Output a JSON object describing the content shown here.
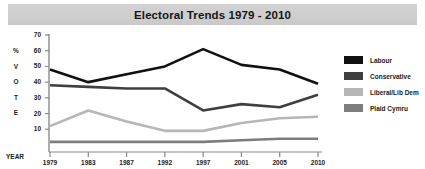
{
  "title": "Electoral Trends 1979 - 2010",
  "axis": {
    "year_label": "YEAR",
    "vote_label_chars": [
      "%",
      "V",
      "O",
      "T",
      "E"
    ]
  },
  "legend": {
    "items": [
      {
        "label": "Labour",
        "color": "#111111"
      },
      {
        "label": "Conservative",
        "color": "#3f3f3f"
      },
      {
        "label": "Liberal/Lib Dem",
        "color": "#b6b6b6"
      },
      {
        "label": "Plaid Cymru",
        "color": "#7d7d7d"
      }
    ]
  },
  "chart_data": {
    "type": "line",
    "title": "Electoral Trends 1979 - 2010",
    "xlabel": "YEAR",
    "ylabel": "% VOTE",
    "x": [
      "1979",
      "1983",
      "1987",
      "1992",
      "1997",
      "2001",
      "2005",
      "2010"
    ],
    "xticklabels": [
      "1979",
      "1983",
      "1987",
      "1992",
      "1997",
      "2001",
      "2005",
      "2010"
    ],
    "yticks": [
      10,
      20,
      30,
      40,
      50,
      60,
      70
    ],
    "ylim": [
      0,
      70
    ],
    "grid": false,
    "legend_position": "right",
    "series": [
      {
        "name": "Labour",
        "color": "#111111",
        "values": [
          48,
          40,
          45,
          50,
          61,
          51,
          48,
          39
        ]
      },
      {
        "name": "Conservative",
        "color": "#3f3f3f",
        "values": [
          38,
          37,
          36,
          36,
          22,
          26,
          24,
          32
        ]
      },
      {
        "name": "Liberal/Lib Dem",
        "color": "#b6b6b6",
        "values": [
          12,
          22,
          15,
          9,
          9,
          14,
          17,
          18
        ]
      },
      {
        "name": "Plaid Cymru",
        "color": "#7d7d7d",
        "values": [
          2,
          2,
          2,
          2,
          2,
          3,
          4,
          4
        ]
      }
    ]
  }
}
